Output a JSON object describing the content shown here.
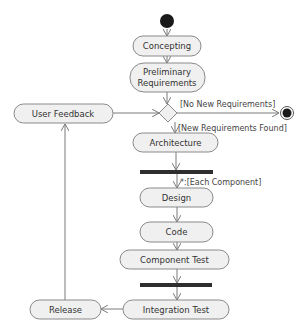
{
  "diagram": {
    "type": "UML activity diagram",
    "initial_node": {
      "label": "start"
    },
    "final_node": {
      "label": "end"
    },
    "activities": [
      {
        "id": "concepting",
        "label": "Concepting"
      },
      {
        "id": "preliminary",
        "label_line1": "Preliminary",
        "label_line2": "Requirements"
      },
      {
        "id": "user_feedback",
        "label": "User Feedback"
      },
      {
        "id": "architecture",
        "label": "Architecture"
      },
      {
        "id": "design",
        "label": "Design"
      },
      {
        "id": "code",
        "label": "Code"
      },
      {
        "id": "component_test",
        "label": "Component Test"
      },
      {
        "id": "integration_test",
        "label": "Integration Test"
      },
      {
        "id": "release",
        "label": "Release"
      }
    ],
    "guards": {
      "no_new": "[No New Requirements]",
      "new_found": "[New Requirements Found]",
      "each_component": "*:[Each Component]"
    },
    "colors": {
      "node_fill": "#f0f0f0",
      "node_stroke": "#8a8a8a",
      "edge": "#7a7a7a",
      "bar": "#2e2e2e",
      "initial": "#1a1a1a"
    }
  }
}
